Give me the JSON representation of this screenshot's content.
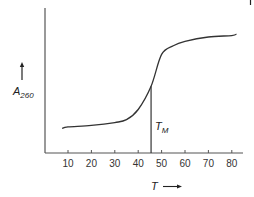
{
  "chart_data": {
    "type": "line",
    "title": "",
    "xlabel": "T",
    "ylabel": "A260",
    "ylabel_main": "A",
    "ylabel_sub": "260",
    "x_ticks": [
      10,
      20,
      30,
      40,
      50,
      60,
      70,
      80
    ],
    "x_tick_labels": [
      "10",
      "20",
      "30",
      "40",
      "50",
      "60",
      "70",
      "80"
    ],
    "xlim": [
      0,
      85
    ],
    "ylim": [
      0,
      1
    ],
    "y_ticks": [],
    "grid": false,
    "legend": null,
    "series": [
      {
        "name": "A260 melting curve",
        "x": [
          7.5,
          10,
          20,
          30,
          35,
          40,
          45.5,
          50,
          55,
          60,
          70,
          80,
          82
        ],
        "y": [
          0.17,
          0.18,
          0.19,
          0.21,
          0.23,
          0.3,
          0.46,
          0.68,
          0.74,
          0.77,
          0.8,
          0.81,
          0.82
        ]
      }
    ],
    "annotations": [
      {
        "type": "vertical-line",
        "x": 45.5,
        "label": "T",
        "label_sub": "M",
        "full_label": "TM (melting temperature)"
      }
    ]
  },
  "labels": {
    "x_axis_title": "T",
    "y_axis_title_main": "A",
    "y_axis_title_sub": "260",
    "tm_main": "T",
    "tm_sub": "M"
  },
  "colors": {
    "axis": "#444444",
    "curve": "#333333",
    "text": "#222222"
  }
}
